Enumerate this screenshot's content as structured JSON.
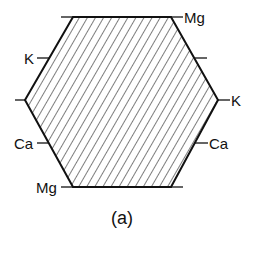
{
  "figure": {
    "caption": "(a)",
    "hexagon": {
      "fill_pattern": "diagonal-hatch",
      "stroke_color": "#111111",
      "vertices": [
        [
          73,
          17
        ],
        [
          171,
          17
        ],
        [
          218,
          100
        ],
        [
          171,
          187
        ],
        [
          73,
          187
        ],
        [
          25,
          100
        ]
      ]
    },
    "labels": {
      "top_right": "Mg",
      "upper_left_edge": "K",
      "right_vertex": "K",
      "lower_left_edge": "Ca",
      "lower_right_edge": "Ca",
      "bottom_left": "Mg"
    }
  }
}
